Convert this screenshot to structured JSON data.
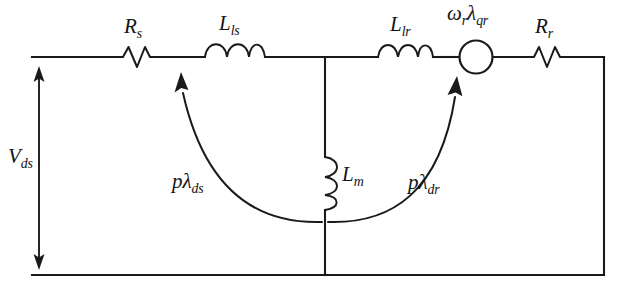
{
  "diagram": {
    "type": "electrical-circuit-schematic",
    "background_color": "#ffffff",
    "line_color": "#1a1a1a"
  },
  "labels": {
    "source_voltage": {
      "base": "V",
      "sub": "ds",
      "text": "V_ds"
    },
    "stator_resistance": {
      "base": "R",
      "sub": "s",
      "text": "R_s"
    },
    "stator_leakage_inductance": {
      "base": "L",
      "sub": "ls",
      "text": "L_ls"
    },
    "rotor_leakage_inductance": {
      "base": "L",
      "sub": "lr",
      "text": "L_lr"
    },
    "magnetizing_inductance": {
      "base": "L",
      "sub": "m",
      "text": "L_m"
    },
    "rotor_resistance": {
      "base": "R",
      "sub": "r",
      "text": "R_r"
    },
    "speed_emf_source": {
      "base": "ω",
      "sub1": "r",
      "base2": "λ",
      "sub2": "qr",
      "text": "ω_r λ_qr"
    },
    "stator_flux_derivative": {
      "base": "pλ",
      "sub": "ds",
      "text": "pλ_ds"
    },
    "rotor_flux_derivative": {
      "base": "pλ",
      "sub": "dr",
      "text": "pλ_dr"
    }
  },
  "components": [
    {
      "name": "stator-resistor",
      "symbol": "resistor",
      "label": "R_s",
      "orientation": "horizontal"
    },
    {
      "name": "stator-leakage-inductor",
      "symbol": "inductor",
      "label": "L_ls",
      "orientation": "horizontal"
    },
    {
      "name": "magnetizing-inductor",
      "symbol": "inductor",
      "label": "L_m",
      "orientation": "vertical"
    },
    {
      "name": "rotor-leakage-inductor",
      "symbol": "inductor",
      "label": "L_lr",
      "orientation": "horizontal"
    },
    {
      "name": "speed-voltage-source",
      "symbol": "circle-source",
      "label": "ω_r λ_qr",
      "orientation": "horizontal"
    },
    {
      "name": "rotor-resistor",
      "symbol": "resistor",
      "label": "R_r",
      "orientation": "horizontal"
    }
  ],
  "annotations": [
    {
      "name": "source-voltage-arrow",
      "symbol": "double-headed-vertical-arrow",
      "label": "V_ds"
    },
    {
      "name": "stator-flux-arrow",
      "symbol": "curved-arrow",
      "label": "pλ_ds"
    },
    {
      "name": "rotor-flux-arrow",
      "symbol": "curved-arrow",
      "label": "pλ_dr"
    }
  ]
}
